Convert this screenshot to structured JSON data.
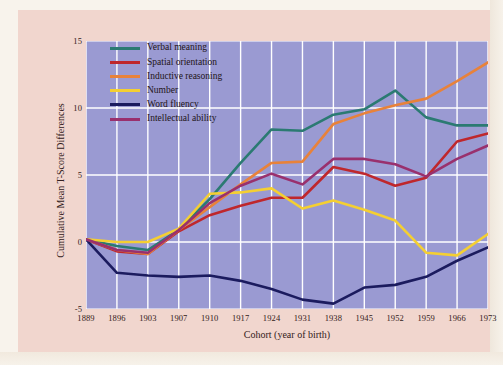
{
  "chart_data": {
    "type": "line",
    "title": "",
    "xlabel": "Cohort (year of birth)",
    "ylabel": "Cumulative Mean T-Score Differences",
    "categories": [
      1889,
      1896,
      1903,
      1907,
      1910,
      1917,
      1924,
      1931,
      1938,
      1945,
      1952,
      1959,
      1966,
      1973
    ],
    "xtick_labels": [
      "1889",
      "1896",
      "1903",
      "1907",
      "1910",
      "1917",
      "1924",
      "1931",
      "1938",
      "1945",
      "1952",
      "1959",
      "1966",
      "1973"
    ],
    "ytick_labels": [
      "15",
      "10",
      "5",
      "0",
      "-5"
    ],
    "ytick_values": [
      15,
      10,
      5,
      0,
      -5
    ],
    "ylim": [
      -5,
      15
    ],
    "grid": true,
    "legend_position": "upper-left",
    "series": [
      {
        "name": "Verbal meaning",
        "color": "#2b7a72",
        "values": [
          0.2,
          -0.3,
          -0.6,
          0.9,
          3.2,
          5.9,
          8.4,
          8.3,
          9.5,
          9.9,
          11.3,
          9.3,
          8.7,
          8.7
        ]
      },
      {
        "name": "Spatial orientation",
        "color": "#bf272c",
        "values": [
          0.2,
          -0.7,
          -0.9,
          0.8,
          2.0,
          2.7,
          3.3,
          3.3,
          5.6,
          5.1,
          4.2,
          4.8,
          7.5,
          8.1
        ]
      },
      {
        "name": "Inductive reasoning",
        "color": "#e8823a",
        "values": [
          0.2,
          -0.6,
          -0.9,
          0.9,
          2.6,
          4.3,
          5.9,
          6.0,
          8.8,
          9.6,
          10.2,
          10.7,
          12.0,
          13.4
        ]
      },
      {
        "name": "Number",
        "color": "#f4cf32",
        "values": [
          0.2,
          0.0,
          0.0,
          1.0,
          3.6,
          3.7,
          4.0,
          2.5,
          3.1,
          2.4,
          1.6,
          -0.8,
          -1.0,
          0.6
        ]
      },
      {
        "name": "Word fluency",
        "color": "#1b1b5e",
        "values": [
          0.2,
          -2.3,
          -2.5,
          -2.6,
          -2.5,
          -2.9,
          -3.5,
          -4.3,
          -4.6,
          -3.4,
          -3.2,
          -2.6,
          -1.4,
          -0.4
        ]
      },
      {
        "name": "Intellectual ability",
        "color": "#99306d",
        "values": [
          0.2,
          -0.6,
          -0.8,
          0.9,
          2.9,
          4.2,
          5.1,
          4.3,
          6.2,
          6.2,
          5.8,
          4.9,
          6.2,
          7.2
        ]
      }
    ]
  }
}
